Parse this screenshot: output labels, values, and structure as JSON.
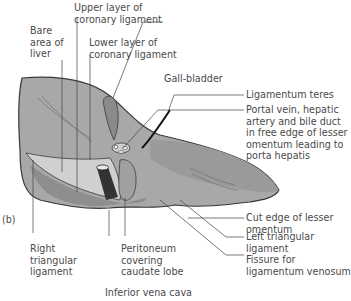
{
  "figure": {
    "panel_label": "(b)",
    "colors": {
      "liver": "#a8a8a8",
      "liver_dark": "#8e8e8e",
      "bare_area": "#d0d0d0",
      "ivc": "#333333",
      "gall_bladder": "#8a8a8a",
      "outline": "#3a3a3a",
      "leader": "#444444",
      "text": "#4a4a4a"
    }
  },
  "labels": {
    "upper_layer": [
      "Upper layer of",
      "coronary ligament"
    ],
    "bare_area": [
      "Bare",
      "area of",
      "liver"
    ],
    "lower_layer": [
      "Lower layer of",
      "coronary ligament"
    ],
    "gall_bladder": [
      "Gall-bladder"
    ],
    "ligamentum_teres": [
      "Ligamentum teres"
    ],
    "portal_vein": [
      "Portal vein, hepatic",
      "artery and bile duct",
      "in free edge of lesser",
      "omentum leading to",
      "porta hepatis"
    ],
    "cut_edge": [
      "Cut edge of lesser",
      "omentum"
    ],
    "left_triangular": [
      "Left triangular",
      "ligament"
    ],
    "fissure": [
      "Fissure for",
      "ligamentum venosum"
    ],
    "right_triangular": [
      "Right",
      "triangular",
      "ligament"
    ],
    "peritoneum": [
      "Peritoneum",
      "covering",
      "caudate lobe"
    ],
    "ivc": [
      "Inferior vena cava"
    ]
  }
}
